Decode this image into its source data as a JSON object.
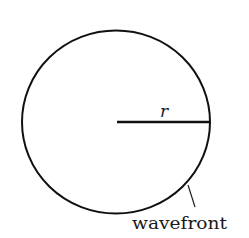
{
  "diagram": {
    "radius_label": "r",
    "wavefront_label": "wavefront",
    "colors": {
      "stroke": "#111111",
      "background": "#ffffff",
      "text": "#1a1a1a"
    }
  }
}
